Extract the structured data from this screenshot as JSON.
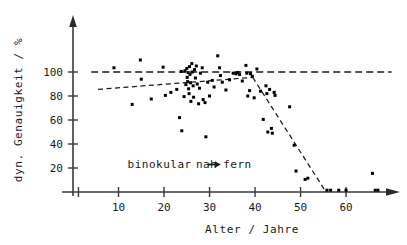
{
  "chart_data": {
    "type": "scatter",
    "title": "",
    "xlabel": "Alter / Jahre",
    "ylabel": "dyn. Genauigkeit / %",
    "xlim": [
      0,
      70
    ],
    "ylim": [
      0,
      125
    ],
    "xticks": [
      10,
      20,
      30,
      40,
      50,
      60
    ],
    "yticks": [
      20,
      40,
      60,
      80,
      100
    ],
    "xtick_labels": [
      "10",
      "20",
      "30",
      "40",
      "50",
      "60"
    ],
    "ytick_labels": [
      "20",
      "40",
      "60",
      "80",
      "100"
    ],
    "grid": false,
    "legend": "none",
    "annotations": [
      {
        "name": "condition-label",
        "text": "binokular",
        "x": 12,
        "y": 20
      },
      {
        "name": "direction-label-near",
        "text": "nah",
        "x": 27,
        "y": 20
      },
      {
        "name": "direction-arrow",
        "text": "→",
        "x": 30.5,
        "y": 20
      },
      {
        "name": "direction-label-far",
        "text": "fern",
        "x": 33,
        "y": 20
      }
    ],
    "reference_lines": [
      {
        "name": "reference-100-percent",
        "orientation": "horizontal",
        "y": 100,
        "style": "dashed",
        "x_start": 4,
        "x_end": 70
      }
    ],
    "trend_lines": [
      {
        "name": "trend-plateau",
        "style": "dashed",
        "points": [
          [
            5.5,
            85.5
          ],
          [
            39.5,
            95.5
          ]
        ]
      },
      {
        "name": "trend-decline",
        "style": "dashed",
        "points": [
          [
            39.5,
            95.5
          ],
          [
            55.5,
            0.5
          ]
        ]
      }
    ],
    "series": [
      {
        "name": "dyn. Genauigkeit binokular nah-fern",
        "marker": "square",
        "color": "#000000",
        "points": [
          [
            9.0,
            103.5
          ],
          [
            13.0,
            73.0
          ],
          [
            14.8,
            110.0
          ],
          [
            15.0,
            94.0
          ],
          [
            17.2,
            77.5
          ],
          [
            19.8,
            104.0
          ],
          [
            20.3,
            80.5
          ],
          [
            21.5,
            83.0
          ],
          [
            22.8,
            85.5
          ],
          [
            23.4,
            62.0
          ],
          [
            23.8,
            100.5
          ],
          [
            23.9,
            51.0
          ],
          [
            24.4,
            79.5
          ],
          [
            24.6,
            101.0
          ],
          [
            24.8,
            89.5
          ],
          [
            25.0,
            103.0
          ],
          [
            25.1,
            95.5
          ],
          [
            25.2,
            92.0
          ],
          [
            25.3,
            99.5
          ],
          [
            25.4,
            86.0
          ],
          [
            25.5,
            82.0
          ],
          [
            25.6,
            104.5
          ],
          [
            25.7,
            98.0
          ],
          [
            25.8,
            91.0
          ],
          [
            25.9,
            75.5
          ],
          [
            26.1,
            107.0
          ],
          [
            26.2,
            100.0
          ],
          [
            26.4,
            88.5
          ],
          [
            26.5,
            79.0
          ],
          [
            26.7,
            102.0
          ],
          [
            26.9,
            95.0
          ],
          [
            27.1,
            105.0
          ],
          [
            27.3,
            90.0
          ],
          [
            27.6,
            73.5
          ],
          [
            27.8,
            86.5
          ],
          [
            28.0,
            99.0
          ],
          [
            28.4,
            103.5
          ],
          [
            28.6,
            77.0
          ],
          [
            29.0,
            74.5
          ],
          [
            29.2,
            46.0
          ],
          [
            29.6,
            91.5
          ],
          [
            30.0,
            80.0
          ],
          [
            30.6,
            93.0
          ],
          [
            31.0,
            87.5
          ],
          [
            31.8,
            113.5
          ],
          [
            32.2,
            103.5
          ],
          [
            32.4,
            97.0
          ],
          [
            32.8,
            91.5
          ],
          [
            33.6,
            85.0
          ],
          [
            34.4,
            93.5
          ],
          [
            35.2,
            99.0
          ],
          [
            35.8,
            98.5
          ],
          [
            36.2,
            99.5
          ],
          [
            36.6,
            98.0
          ],
          [
            37.2,
            92.5
          ],
          [
            38.0,
            105.5
          ],
          [
            38.2,
            99.0
          ],
          [
            38.4,
            80.0
          ],
          [
            38.8,
            84.5
          ],
          [
            39.0,
            98.5
          ],
          [
            39.4,
            96.5
          ],
          [
            39.8,
            78.5
          ],
          [
            40.4,
            102.5
          ],
          [
            41.2,
            84.0
          ],
          [
            41.8,
            60.5
          ],
          [
            42.4,
            88.5
          ],
          [
            42.6,
            82.0
          ],
          [
            42.8,
            50.0
          ],
          [
            43.2,
            85.5
          ],
          [
            43.6,
            53.0
          ],
          [
            43.8,
            49.0
          ],
          [
            44.2,
            83.0
          ],
          [
            44.4,
            80.5
          ],
          [
            47.6,
            71.0
          ],
          [
            48.6,
            39.0
          ],
          [
            49.0,
            17.5
          ],
          [
            51.0,
            10.5
          ],
          [
            51.6,
            11.5
          ],
          [
            55.8,
            1.5
          ],
          [
            56.6,
            1.5
          ],
          [
            58.4,
            1.5
          ],
          [
            60.0,
            1.5
          ],
          [
            65.8,
            15.5
          ],
          [
            66.4,
            1.5
          ],
          [
            67.0,
            1.5
          ]
        ]
      }
    ]
  },
  "figure": {
    "y_axis_arrow": true,
    "x_axis_arrow": true
  }
}
